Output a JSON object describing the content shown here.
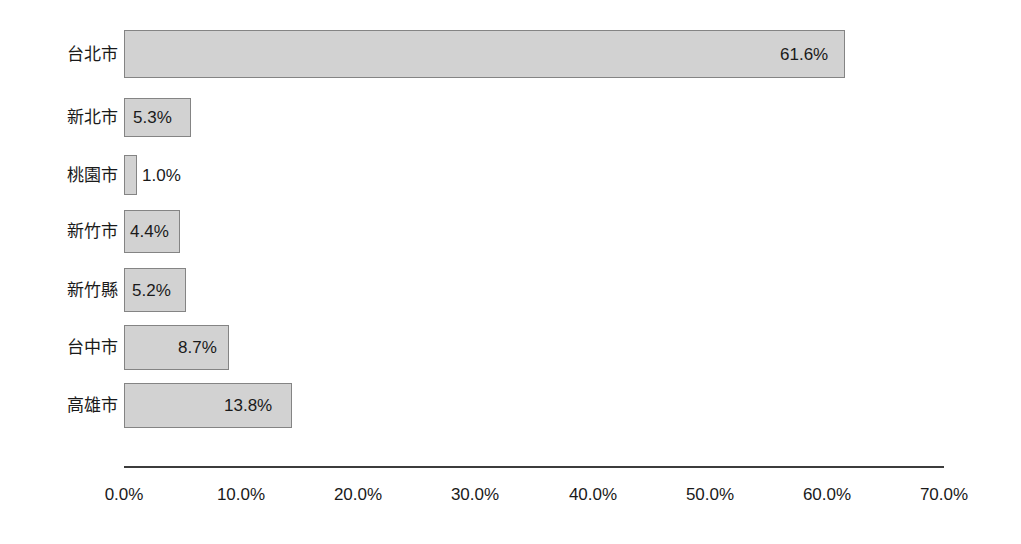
{
  "chart_data": {
    "type": "bar",
    "orientation": "horizontal",
    "title": "",
    "subtitle": "",
    "xlabel": "",
    "ylabel": "",
    "categories": [
      "台北市",
      "新北市",
      "桃園市",
      "新竹市",
      "新竹縣",
      "台中市",
      "高雄市"
    ],
    "values": [
      61.6,
      5.3,
      1.0,
      4.4,
      5.2,
      8.7,
      13.8
    ],
    "data_labels": [
      "61.6%",
      "5.3%",
      "1.0%",
      "4.4%",
      "5.2%",
      "8.7%",
      "13.8%"
    ],
    "xlim": [
      0,
      70
    ],
    "xticks": [
      0,
      10,
      20,
      30,
      40,
      50,
      60,
      70
    ],
    "xtick_labels": [
      "0.0%",
      "10.0%",
      "20.0%",
      "30.0%",
      "40.0%",
      "50.0%",
      "60.0%",
      "70.0%"
    ],
    "grid": false,
    "legend": null,
    "bar_color": "#d2d2d2",
    "bar_border_color": "#848484",
    "axis_color": "#3c3c3c",
    "text_color": "#1a1a1a",
    "background_color": "#ffffff"
  },
  "bars": [
    {
      "category": "台北市",
      "value": 61.6,
      "label": "61.6%",
      "top": 30,
      "height": 48,
      "width": 721,
      "label_left": 780,
      "label_top": 46
    },
    {
      "category": "新北市",
      "value": 5.3,
      "label": "5.3%",
      "top": 98,
      "height": 39,
      "width": 67,
      "label_left": 133,
      "label_top": 110
    },
    {
      "category": "桃園市",
      "value": 1.0,
      "label": "1.0%",
      "top": 155,
      "height": 40,
      "width": 13,
      "label_left": 142,
      "label_top": 167
    },
    {
      "category": "新竹市",
      "value": 4.4,
      "label": "4.4%",
      "top": 210,
      "height": 43,
      "width": 56,
      "label_left": 130,
      "label_top": 224
    },
    {
      "category": "新竹縣",
      "value": 5.2,
      "label": "5.2%",
      "top": 268,
      "height": 44,
      "width": 62,
      "label_left": 132,
      "label_top": 282
    },
    {
      "category": "台中市",
      "value": 8.7,
      "label": "8.7%",
      "top": 325,
      "height": 45,
      "width": 105,
      "label_left": 178,
      "label_top": 340
    },
    {
      "category": "高雄市",
      "value": 13.8,
      "label": "13.8%",
      "top": 383,
      "height": 45,
      "width": 168,
      "label_left": 224,
      "label_top": 398
    }
  ],
  "xticks": [
    {
      "label": "0.0%",
      "left": 124
    },
    {
      "label": "10.0%",
      "left": 241
    },
    {
      "label": "20.0%",
      "left": 358
    },
    {
      "label": "30.0%",
      "left": 475
    },
    {
      "label": "40.0%",
      "left": 593
    },
    {
      "label": "50.0%",
      "left": 710
    },
    {
      "label": "60.0%",
      "left": 827
    },
    {
      "label": "70.0%",
      "left": 944
    }
  ]
}
